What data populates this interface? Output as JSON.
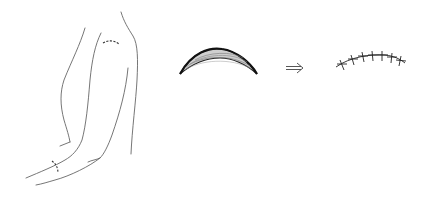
{
  "figure": {
    "panels": [
      {
        "id": "arm",
        "description": "Outline drawing of an arm with marked incision sites at the shoulder and forearm"
      },
      {
        "id": "excised-tissue",
        "description": "Crescent-shaped excised skin/tissue specimen"
      },
      {
        "id": "arrow",
        "description": "Double-line arrow pointing right",
        "glyph": "⇒"
      },
      {
        "id": "sutured-closure",
        "description": "Curved closure line with interrupted sutures"
      }
    ],
    "colors": {
      "line": "#555555",
      "dark": "#222222",
      "shading": "#888888"
    }
  }
}
